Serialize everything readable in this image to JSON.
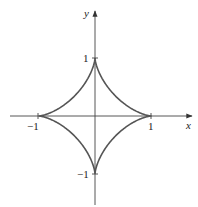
{
  "diagram": {
    "type": "astroid",
    "equation": "x^(2/3) + y^(2/3) = 1",
    "axes": {
      "x_label": "x",
      "y_label": "y",
      "x_ticks": [
        {
          "value": -1,
          "label": "−1"
        },
        {
          "value": 1,
          "label": "1"
        }
      ],
      "y_ticks": [
        {
          "value": 1,
          "label": "1"
        },
        {
          "value": -1,
          "label": "−1"
        }
      ]
    },
    "colors": {
      "curve": "#555555",
      "axes": "#444444",
      "background": "#ffffff"
    }
  }
}
